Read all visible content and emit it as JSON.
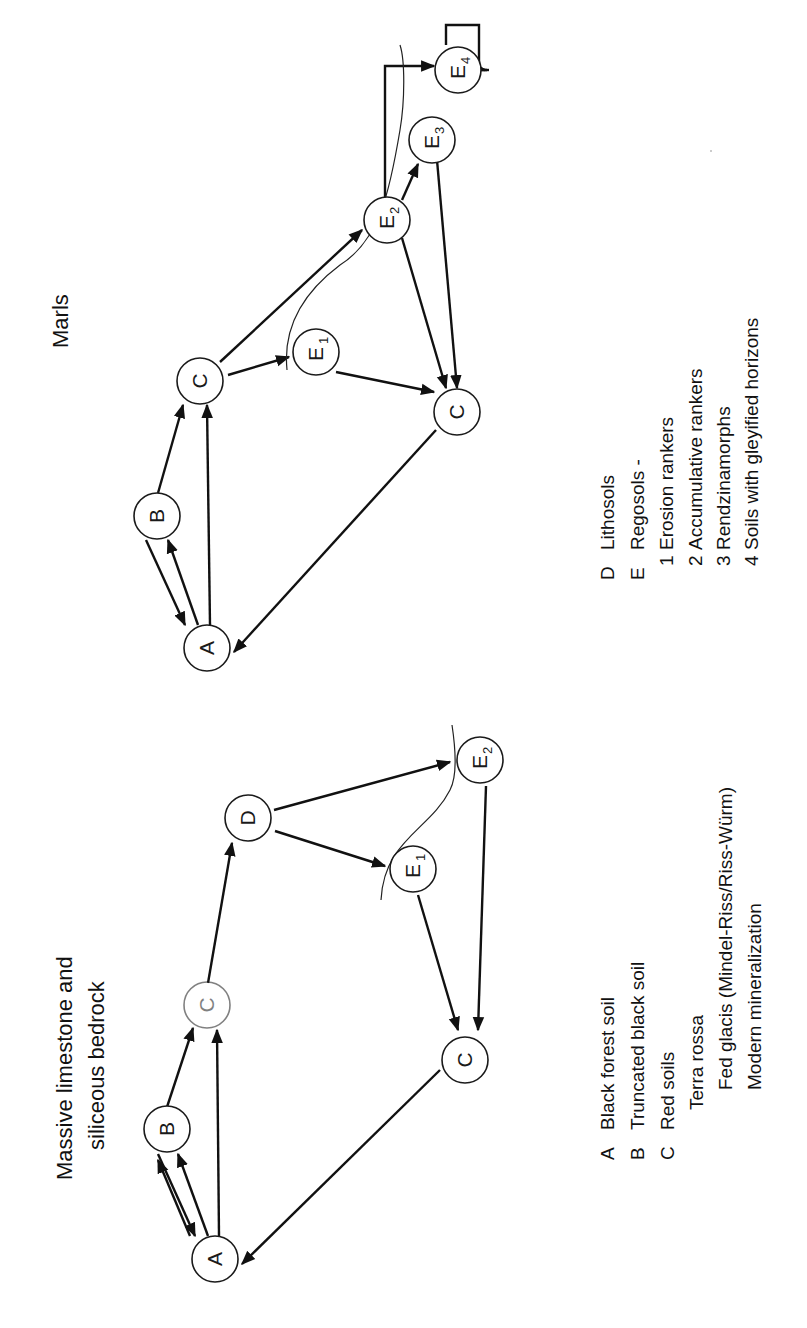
{
  "orientation": "rotated 90 degrees counter-clockwise",
  "left_panel": {
    "title_line1": "Massive limestone and",
    "title_line2": "siliceous bedrock",
    "nodes": {
      "A": {
        "label": "A",
        "sub": ""
      },
      "B": {
        "label": "B",
        "sub": ""
      },
      "C_top": {
        "label": "C",
        "sub": ""
      },
      "D": {
        "label": "D",
        "sub": ""
      },
      "E1": {
        "label": "E",
        "sub": "1"
      },
      "E2": {
        "label": "E",
        "sub": "2"
      },
      "C_bottom": {
        "label": "C",
        "sub": ""
      }
    },
    "edges": [
      [
        "A",
        "B"
      ],
      [
        "B",
        "A"
      ],
      [
        "A",
        "C_top"
      ],
      [
        "B",
        "C_top"
      ],
      [
        "C_top",
        "D"
      ],
      [
        "D",
        "E1"
      ],
      [
        "D",
        "E2"
      ],
      [
        "E1",
        "C_bottom"
      ],
      [
        "E2",
        "C_bottom"
      ],
      [
        "C_bottom",
        "A"
      ]
    ],
    "legend": [
      {
        "key": "A",
        "text": "Black forest soil"
      },
      {
        "key": "B",
        "text": "Truncated black soil"
      },
      {
        "key": "C",
        "text": "Red soils"
      },
      {
        "key": "",
        "text": "Terra rossa",
        "indent": 1
      },
      {
        "key": "",
        "text": "Fed glacis (Mindel-Riss/Riss-Würm)",
        "indent": 2
      },
      {
        "key": "",
        "text": "Modern mineralization",
        "indent": 2
      }
    ]
  },
  "right_panel": {
    "title": "Marls",
    "nodes": {
      "A": {
        "label": "A",
        "sub": ""
      },
      "B": {
        "label": "B",
        "sub": ""
      },
      "C_top": {
        "label": "C",
        "sub": ""
      },
      "E1": {
        "label": "E",
        "sub": "1"
      },
      "E2": {
        "label": "E",
        "sub": "2"
      },
      "E3": {
        "label": "E",
        "sub": "3"
      },
      "E4": {
        "label": "E",
        "sub": "4"
      },
      "C_bottom": {
        "label": "C",
        "sub": ""
      }
    },
    "edges": [
      [
        "A",
        "B"
      ],
      [
        "B",
        "A"
      ],
      [
        "A",
        "C_top"
      ],
      [
        "B",
        "C_top"
      ],
      [
        "C_top",
        "E1"
      ],
      [
        "C_top",
        "E2"
      ],
      [
        "E2",
        "E3"
      ],
      [
        "E2",
        "E4"
      ],
      [
        "E4",
        "E4"
      ],
      [
        "E1",
        "C_bottom"
      ],
      [
        "E2",
        "C_bottom"
      ],
      [
        "E3",
        "C_bottom"
      ],
      [
        "C_bottom",
        "A"
      ]
    ],
    "legend": [
      {
        "key": "D",
        "text": "Lithosols"
      },
      {
        "key": "E",
        "text": "Regosols -"
      },
      {
        "key": "1",
        "text": "Erosion rankers",
        "indent": 1
      },
      {
        "key": "2",
        "text": "Accumulative rankers",
        "indent": 1
      },
      {
        "key": "3",
        "text": "Rendzinamorphs",
        "indent": 1
      },
      {
        "key": "4",
        "text": "Soils with gleyified horizons",
        "indent": 1
      }
    ]
  }
}
